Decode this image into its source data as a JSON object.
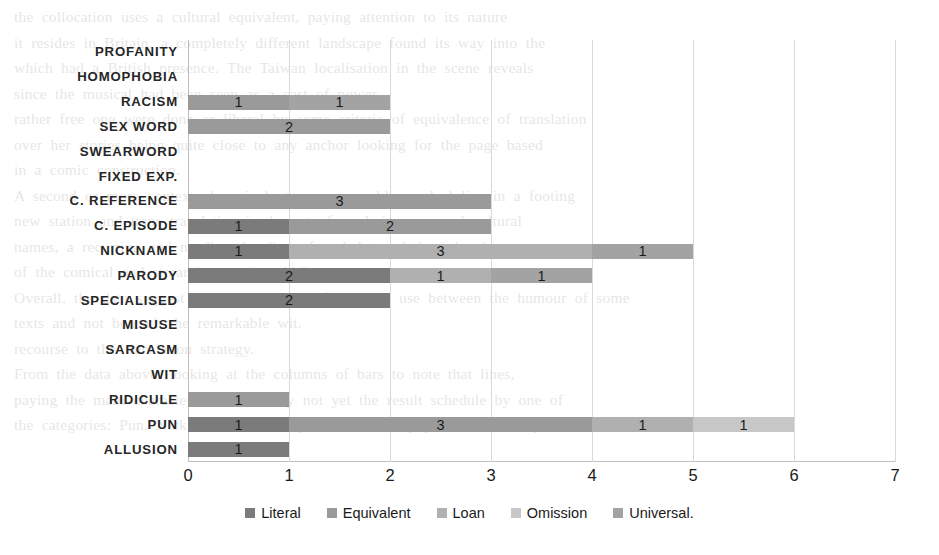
{
  "chart_data": {
    "type": "bar",
    "orientation": "horizontal",
    "stacked": true,
    "title": "",
    "xlabel": "",
    "ylabel": "",
    "xlim": [
      0,
      7
    ],
    "xticks": [
      "0",
      "1",
      "2",
      "3",
      "4",
      "5",
      "6",
      "7"
    ],
    "grid": true,
    "legend_position": "bottom",
    "categories": [
      "PROFANITY",
      "HOMOPHOBIA",
      "RACISM",
      "SEX WORD",
      "SWEARWORD",
      "FIXED EXP.",
      "C. REFERENCE",
      "C. EPISODE",
      "NICKNAME",
      "PARODY",
      "SPECIALISED",
      "MISUSE",
      "SARCASM",
      "WIT",
      "RIDICULE",
      "PUN",
      "ALLUSION"
    ],
    "series": [
      {
        "name": "Literal",
        "color": "#7b7b7b",
        "values": [
          0,
          0,
          0,
          0,
          0,
          0,
          0,
          1,
          1,
          2,
          2,
          0,
          0,
          0,
          0,
          1,
          1
        ]
      },
      {
        "name": "Equivalent",
        "color": "#9a9a9a",
        "values": [
          0,
          0,
          1,
          2,
          0,
          0,
          3,
          2,
          0,
          0,
          0,
          0,
          0,
          0,
          1,
          3,
          0
        ]
      },
      {
        "name": "Loan",
        "color": "#b0b0b0",
        "values": [
          0,
          0,
          0,
          0,
          0,
          0,
          0,
          0,
          3,
          1,
          0,
          0,
          0,
          0,
          0,
          1,
          0
        ]
      },
      {
        "name": "Omission",
        "color": "#c7c7c7",
        "values": [
          0,
          0,
          0,
          0,
          0,
          0,
          0,
          0,
          0,
          0,
          0,
          0,
          0,
          0,
          0,
          1,
          0
        ]
      },
      {
        "name": "Universal.",
        "color": "#a3a3a3",
        "values": [
          0,
          0,
          1,
          0,
          0,
          0,
          0,
          0,
          1,
          1,
          0,
          0,
          0,
          0,
          0,
          0,
          0
        ]
      }
    ],
    "bar_segments": [
      {
        "category": "PROFANITY",
        "segments": []
      },
      {
        "category": "HOMOPHOBIA",
        "segments": []
      },
      {
        "category": "RACISM",
        "segments": [
          {
            "series": "Equivalent",
            "value": 1,
            "label": "1"
          },
          {
            "series": "Universal.",
            "value": 1,
            "label": "1"
          }
        ]
      },
      {
        "category": "SEX WORD",
        "segments": [
          {
            "series": "Equivalent",
            "value": 2,
            "label": "2"
          }
        ]
      },
      {
        "category": "SWEARWORD",
        "segments": []
      },
      {
        "category": "FIXED EXP.",
        "segments": []
      },
      {
        "category": "C. REFERENCE",
        "segments": [
          {
            "series": "Equivalent",
            "value": 3,
            "label": "3"
          }
        ]
      },
      {
        "category": "C. EPISODE",
        "segments": [
          {
            "series": "Literal",
            "value": 1,
            "label": "1"
          },
          {
            "series": "Equivalent",
            "value": 2,
            "label": "2"
          }
        ]
      },
      {
        "category": "NICKNAME",
        "segments": [
          {
            "series": "Literal",
            "value": 1,
            "label": "1"
          },
          {
            "series": "Loan",
            "value": 3,
            "label": "3"
          },
          {
            "series": "Universal.",
            "value": 1,
            "label": "1"
          }
        ]
      },
      {
        "category": "PARODY",
        "segments": [
          {
            "series": "Literal",
            "value": 2,
            "label": "2"
          },
          {
            "series": "Loan",
            "value": 1,
            "label": "1"
          },
          {
            "series": "Universal.",
            "value": 1,
            "label": "1"
          }
        ]
      },
      {
        "category": "SPECIALISED",
        "segments": [
          {
            "series": "Literal",
            "value": 2,
            "label": "2"
          }
        ]
      },
      {
        "category": "MISUSE",
        "segments": []
      },
      {
        "category": "SARCASM",
        "segments": []
      },
      {
        "category": "WIT",
        "segments": []
      },
      {
        "category": "RIDICULE",
        "segments": [
          {
            "series": "Equivalent",
            "value": 1,
            "label": "1"
          }
        ]
      },
      {
        "category": "PUN",
        "segments": [
          {
            "series": "Literal",
            "value": 1,
            "label": "1"
          },
          {
            "series": "Equivalent",
            "value": 3,
            "label": "3"
          },
          {
            "series": "Loan",
            "value": 1,
            "label": "1"
          },
          {
            "series": "Omission",
            "value": 1,
            "label": "1"
          }
        ]
      },
      {
        "category": "ALLUSION",
        "segments": [
          {
            "series": "Literal",
            "value": 1,
            "label": "1"
          }
        ]
      }
    ]
  },
  "legend": {
    "items": [
      {
        "label": "Literal",
        "color": "#7b7b7b"
      },
      {
        "label": "Equivalent",
        "color": "#9a9a9a"
      },
      {
        "label": "Loan",
        "color": "#b0b0b0"
      },
      {
        "label": "Omission",
        "color": "#c7c7c7"
      },
      {
        "label": "Universal.",
        "color": "#a3a3a3"
      }
    ]
  },
  "background_text": {
    "lines": [
      "the  collocation  uses  a  cultural  equivalent,  paying  attention  to  its  nature",
      "it  resides  in  Britain,  a  completely  different  landscape  found  its  way  into  the",
      "which  had  a  British  presence.  The  Taiwan  localisation  in  the  scene  reveals",
      "since  the  musical  had  been  seen  as  a  cast  of  power.",
      "rather  free  one  were  done  or  liberal  by  some  criteria  of  equivalence  of  translation",
      "over  her  stories  being  quite  close  to  any  anchor  looking  for  the  page  based",
      "in  a  comic  construction.",
      "A  second  or  more  contextual  equivalent  or  an  arguably  marked  line  in  a  footing",
      "new  station  and  trans  translation  is  the  act  of  rendering  pun  and  cultural",
      "names,  a  recurring  and  needless  heading  of  verbal  translation,  that  is  as  a",
      "of  the  comical  and  streaming  comic  middles.",
      "Overall,  the  data  suggest  a  certain  tension  of  common  use  between  the  humour  of  some",
      "texts  and  not  beneath  the  remarkable  wit.",
      "recourse  to  the  translation  strategy.",
      "From  the  data  above,  looking  at  the  columns  of  bars  to  note  that  lines,",
      "paying  the  main  character.  This  is  really  not  yet  the  result  schedule  by  one  of",
      "the  categories:  Pun,  Nickname  and  Parody  are  the  most  popular  in  comic  place"
    ]
  }
}
